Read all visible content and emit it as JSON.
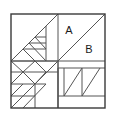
{
  "figure": {
    "name": "geometric-dissection-square",
    "background_color": "#ffffff",
    "stroke_color": "#555555",
    "outer_stroke_color": "#3a3a3a",
    "fill_color": "#ffffff",
    "square": {
      "x": 11,
      "y": 14,
      "size": 94
    },
    "center": {
      "x": 58,
      "y": 61
    }
  },
  "labels": {
    "a": {
      "text": "A",
      "x": 69,
      "y": 31
    },
    "b": {
      "text": "B",
      "x": 89,
      "y": 50
    }
  },
  "quadrants": {
    "top_left": {
      "name": "nested-triangles-quadrant"
    },
    "top_right": {
      "name": "diagonal-split-quadrant"
    },
    "bottom_left": {
      "name": "pinwheel-quadrant"
    },
    "bottom_right": {
      "name": "triangle-pair-quadrant"
    }
  }
}
